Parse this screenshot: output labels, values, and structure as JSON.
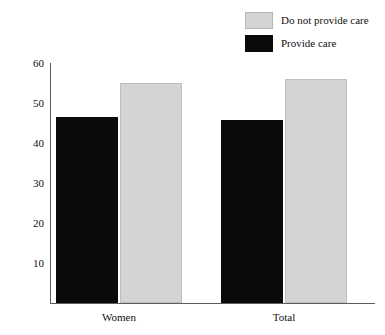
{
  "chart_data": {
    "type": "bar",
    "title": "",
    "subtitle": "",
    "xlabel": "",
    "ylabel": "",
    "categories": [
      "Women",
      "Total"
    ],
    "series": [
      {
        "name": "Provide care",
        "color": "#0a0a0a",
        "values": [
          46.5,
          45.8
        ]
      },
      {
        "name": "Do not provide care",
        "color": "#d4d4d4",
        "values": [
          55.0,
          56.0
        ]
      }
    ],
    "yticks": [
      10,
      20,
      30,
      40,
      50,
      60
    ],
    "ytick_labels": [
      "10",
      "20",
      "30",
      "40",
      "50",
      "60"
    ],
    "ylim": [
      0,
      60
    ],
    "grid": false,
    "legend_position": "top-right",
    "legend_order": [
      "Do not provide care",
      "Provide care"
    ]
  },
  "legend": {
    "items": [
      {
        "label": "Do not provide care",
        "swatch": "gray"
      },
      {
        "label": "Provide care",
        "swatch": "black"
      }
    ]
  }
}
